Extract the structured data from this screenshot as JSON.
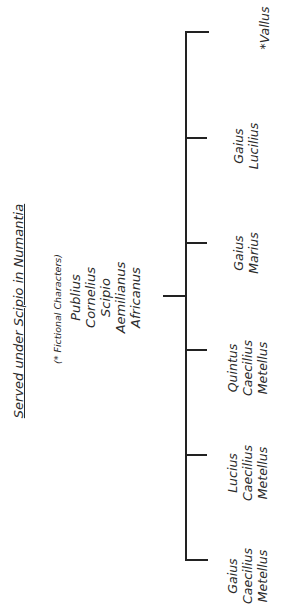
{
  "title": "Served under Scipio in Numantia",
  "subtitle": "(* Fictional Characters)",
  "root": {
    "lines": [
      "Publius",
      "Cornelius",
      "Scipio",
      "Aemilianus",
      "Africanus"
    ]
  },
  "children": [
    {
      "lines": [
        "*Vallus"
      ]
    },
    {
      "lines": [
        "Gaius",
        "Lucilius"
      ]
    },
    {
      "lines": [
        "Gaius",
        "Marius"
      ]
    },
    {
      "lines": [
        "Quintus",
        "Caecilius",
        "Metellus"
      ]
    },
    {
      "lines": [
        "Lucius",
        "Caecilius",
        "Metellus"
      ]
    },
    {
      "lines": [
        "Gaius",
        "Caecilius",
        "Metellus"
      ]
    }
  ],
  "line_color": "#222222"
}
